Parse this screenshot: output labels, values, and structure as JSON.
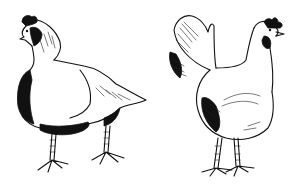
{
  "image": {
    "description": "Black and white ink illustration of two chickens",
    "background": "#ffffff",
    "ink_color": "#111111",
    "subjects": [
      {
        "id": "left-chicken",
        "label": "Chicken facing left, standing, front three-quarter view"
      },
      {
        "id": "right-chicken",
        "label": "Hen facing right, side view with upright tail"
      }
    ]
  }
}
